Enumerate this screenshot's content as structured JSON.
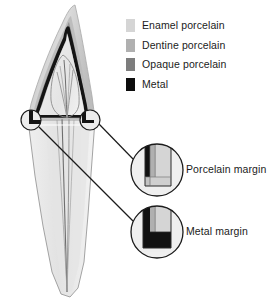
{
  "figure": {
    "background_color": "#ffffff"
  },
  "legend": {
    "name": "materials-legend",
    "items": [
      {
        "id": "enamel-porcelain",
        "label": "Enamel porcelain",
        "color": "#d5d5d5"
      },
      {
        "id": "dentine-porcelain",
        "label": "Dentine porcelain",
        "color": "#b0b0b0"
      },
      {
        "id": "opaque-porcelain",
        "label": "Opaque porcelain",
        "color": "#7d7d7d"
      },
      {
        "id": "metal",
        "label": "Metal",
        "color": "#0d0d0d"
      }
    ]
  },
  "callouts": [
    {
      "id": "porcelain-margin",
      "label": "Porcelain margin",
      "circle": {
        "cx": 157,
        "cy": 170,
        "r": 26
      },
      "source_circle": {
        "cx": 90,
        "cy": 120,
        "r": 10
      }
    },
    {
      "id": "metal-margin",
      "label": "Metal margin",
      "circle": {
        "cx": 157,
        "cy": 232,
        "r": 26
      },
      "source_circle": {
        "cx": 31,
        "cy": 120,
        "r": 10
      }
    }
  ],
  "tooth": {
    "name": "maxillary-incisor-cross-section",
    "parts": [
      {
        "id": "enamel-porcelain-layer",
        "label": "Enamel porcelain",
        "color": "#d5d5d5"
      },
      {
        "id": "dentine-porcelain-layer",
        "label": "Dentine porcelain",
        "color": "#b3b3b3"
      },
      {
        "id": "opaque-porcelain-layer",
        "label": "Opaque porcelain",
        "color": "#8a8a8a"
      },
      {
        "id": "metal-coping-layer",
        "label": "Metal",
        "color": "#111111"
      },
      {
        "id": "tooth-preparation",
        "label": "Prepared tooth",
        "color": "#ededed"
      },
      {
        "id": "root-dentine",
        "label": "Root",
        "color": "#e9e9e9"
      },
      {
        "id": "pulp-chamber",
        "label": "Pulp / root canal",
        "color": "#9a9a9a"
      }
    ]
  },
  "colors": {
    "outline": "#1b1b1b",
    "leader_line": "#1b1b1b",
    "text": "#1b1b1b",
    "enamel": "#d5d5d5",
    "dentine": "#b0b0b0",
    "opaque": "#7d7d7d",
    "metal": "#0d0d0d",
    "prep": "#ededed",
    "root": "#e9e9e9"
  }
}
